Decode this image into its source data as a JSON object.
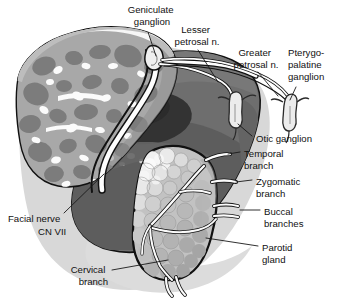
{
  "figure": {
    "background_color": "#ffffff",
    "width": 338,
    "height": 302
  },
  "palette": {
    "outline": "#111111",
    "nerve_white": "#fdfdfd",
    "bone_light": "#c9c9c9",
    "bone_mid": "#9a9a9a",
    "bone_dark": "#7b7b7b",
    "soft_tissue": "#6e6e6e",
    "soft_tissue_dark": "#5a5a5a",
    "canal_dark": "#333333",
    "gland_fill": "#c2c2c2",
    "gland_lobule_light": "#e6e6e6",
    "gland_lobule_mid": "#b0b0b0",
    "shadow": "#d6d6d6",
    "label_text": "#111111"
  },
  "labels": [
    {
      "id": "geniculate-ganglion",
      "lines": [
        "Geniculate",
        "ganglion"
      ],
      "align": "middle",
      "x": 152,
      "y": 12,
      "line_height": 12
    },
    {
      "id": "lesser-petrosal-nerve",
      "lines": [
        "Lesser",
        "petrosal n."
      ],
      "align": "middle",
      "x": 197,
      "y": 32,
      "line_height": 12
    },
    {
      "id": "greater-petrosal-nerve",
      "lines": [
        "Greater",
        "petrosal n."
      ],
      "align": "middle",
      "x": 256,
      "y": 55,
      "line_height": 12
    },
    {
      "id": "pterygopalatine-ganglion",
      "lines": [
        "Pterygo-",
        "palatine",
        "ganglion"
      ],
      "align": "start",
      "x": 288,
      "y": 55,
      "line_height": 12
    },
    {
      "id": "otic-ganglion",
      "lines": [
        "Otic ganglion"
      ],
      "align": "start",
      "x": 256,
      "y": 139,
      "line_height": 12
    },
    {
      "id": "temporal-branch",
      "lines": [
        "Temporal",
        "branch"
      ],
      "align": "start",
      "x": 244,
      "y": 156,
      "line_height": 12
    },
    {
      "id": "zygomatic-branch",
      "lines": [
        "Zygomatic",
        "branch"
      ],
      "align": "start",
      "x": 256,
      "y": 184,
      "line_height": 12
    },
    {
      "id": "buccal-branches",
      "lines": [
        "Buccal",
        "branches"
      ],
      "align": "start",
      "x": 264,
      "y": 214,
      "line_height": 12
    },
    {
      "id": "parotid-gland",
      "lines": [
        "Parotid",
        "gland"
      ],
      "align": "start",
      "x": 262,
      "y": 250,
      "line_height": 12
    },
    {
      "id": "facial-nerve-cn-vii",
      "lines": [
        "Facial nerve",
        "CN VII"
      ],
      "align": "start",
      "x": 8,
      "y": 219,
      "line_height": 13,
      "second_line_indent": 30
    },
    {
      "id": "cervical-branch",
      "lines": [
        "Cervical",
        "branch"
      ],
      "align": "end",
      "x": 108,
      "y": 272,
      "line_height": 12
    }
  ],
  "structures": [
    {
      "id": "temporal-bone",
      "name": "Temporal bone with trabecular marrow"
    },
    {
      "id": "external-auditory-canal",
      "name": "External auditory canal"
    },
    {
      "id": "facial-nerve-trunk",
      "name": "Facial nerve trunk"
    },
    {
      "id": "geniculate-ganglion-structure",
      "name": "Geniculate ganglion"
    },
    {
      "id": "greater-petrosal-nerve-structure",
      "name": "Greater petrosal nerve"
    },
    {
      "id": "lesser-petrosal-nerve-structure",
      "name": "Lesser petrosal nerve"
    },
    {
      "id": "otic-ganglion-structure",
      "name": "Otic ganglion"
    },
    {
      "id": "pterygopalatine-ganglion-structure",
      "name": "Pterygopalatine ganglion"
    },
    {
      "id": "parotid-gland-structure",
      "name": "Parotid gland"
    },
    {
      "id": "temporal-branch-structure",
      "name": "Temporal branch"
    },
    {
      "id": "zygomatic-branch-structure",
      "name": "Zygomatic branch"
    },
    {
      "id": "buccal-branches-structure",
      "name": "Buccal branches"
    },
    {
      "id": "cervical-branch-structure",
      "name": "Cervical branch"
    }
  ]
}
